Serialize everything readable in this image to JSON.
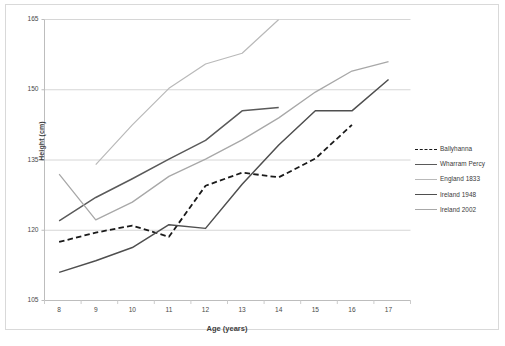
{
  "chart_data": {
    "type": "line",
    "title": "",
    "xlabel": "Age (years)",
    "ylabel": "Height (cm)",
    "x": [
      8,
      9,
      10,
      11,
      12,
      13,
      14,
      15,
      16,
      17
    ],
    "xticks": [
      "8",
      "9",
      "10",
      "11",
      "12",
      "13",
      "14",
      "15",
      "16",
      "17"
    ],
    "yticks": [
      "105",
      "120",
      "135",
      "150",
      "165"
    ],
    "xlim": [
      7.6,
      17.6
    ],
    "ylim": [
      105,
      165
    ],
    "grid": "horizontal",
    "legend_position": "right",
    "series": [
      {
        "name": "Ballyhanna",
        "style": "dashed",
        "color": "#1a1a1a",
        "width": 1.8,
        "x": [
          8,
          9,
          10,
          11,
          12,
          13,
          14,
          15,
          16
        ],
        "values": [
          117.5,
          119.5,
          121.0,
          118.6,
          129.5,
          132.3,
          131.3,
          135.3,
          142.5
        ]
      },
      {
        "name": "Wharram Percy",
        "style": "solid",
        "color": "#5a5a5a",
        "width": 1.5,
        "x": [
          8,
          9,
          10,
          11,
          12,
          13,
          14
        ],
        "values": [
          122.0,
          127.0,
          131.0,
          135.2,
          139.2,
          145.5,
          146.2
        ]
      },
      {
        "name": "England 1833",
        "style": "solid",
        "color": "#b9b9b9",
        "width": 1.2,
        "x": [
          9,
          10,
          11,
          12,
          13,
          14
        ],
        "values": [
          134.0,
          142.5,
          150.3,
          155.5,
          157.8,
          165.0
        ]
      },
      {
        "name": "Ireland 1948",
        "style": "solid",
        "color": "#4f4f4f",
        "width": 1.5,
        "x": [
          8,
          9,
          10,
          11,
          12,
          13,
          14,
          15,
          16,
          17
        ],
        "values": [
          111.0,
          113.5,
          116.3,
          121.2,
          120.4,
          129.8,
          138.2,
          145.5,
          145.5,
          152.2
        ]
      },
      {
        "name": "Ireland 2002",
        "style": "solid",
        "color": "#a8a8a8",
        "width": 1.3,
        "x": [
          8,
          9,
          10,
          11,
          12,
          13,
          14,
          15,
          16,
          17
        ],
        "values": [
          132.0,
          122.2,
          126.0,
          131.5,
          135.2,
          139.3,
          144.0,
          149.5,
          154.0,
          156.0
        ]
      }
    ]
  },
  "legend": {
    "items": [
      {
        "label": "Ballyhanna"
      },
      {
        "label": "Wharram Percy"
      },
      {
        "label": "England 1833"
      },
      {
        "label": "Ireland 1948"
      },
      {
        "label": "Ireland 2002"
      }
    ]
  }
}
